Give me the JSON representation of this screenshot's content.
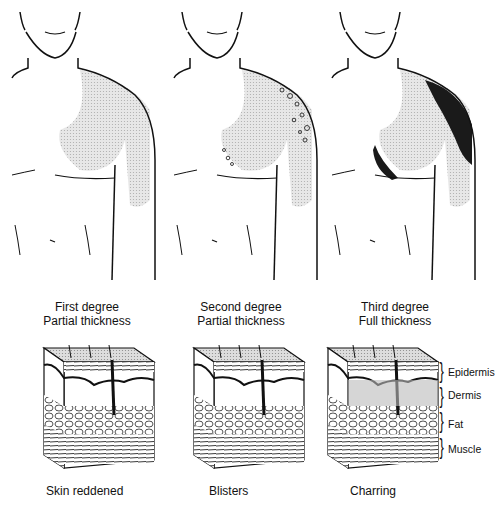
{
  "burns": [
    {
      "degree": "First degree",
      "thickness": "Partial thickness",
      "effect": "Skin reddened",
      "figure_icon": "torso-first-degree-icon",
      "block_icon": "skin-cross-section-first-icon"
    },
    {
      "degree": "Second degree",
      "thickness": "Partial thickness",
      "effect": "Blisters",
      "figure_icon": "torso-second-degree-icon",
      "block_icon": "skin-cross-section-second-icon"
    },
    {
      "degree": "Third degree",
      "thickness": "Full thickness",
      "effect": "Charring",
      "figure_icon": "torso-third-degree-icon",
      "block_icon": "skin-cross-section-third-icon"
    }
  ],
  "layers": [
    "Epidermis",
    "Dermis",
    "Fat",
    "Muscle"
  ],
  "colors": {
    "ink": "#111111",
    "shade": "#c8c8c8",
    "char": "#1a1a1a",
    "background": "#ffffff"
  }
}
